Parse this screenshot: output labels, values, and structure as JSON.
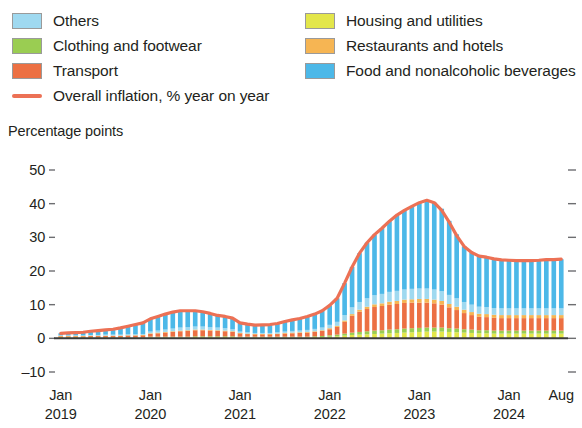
{
  "legend": {
    "left_column": [
      {
        "label": "Others",
        "color": "#9fd9f0",
        "type": "swatch",
        "name": "others"
      },
      {
        "label": "Clothing and footwear",
        "color": "#9acd52",
        "type": "swatch",
        "name": "clothing-and-footwear"
      },
      {
        "label": "Transport",
        "color": "#ec7043",
        "type": "swatch",
        "name": "transport"
      },
      {
        "label": "Overall inflation, % year on year",
        "color": "#ec7155",
        "type": "line",
        "name": "overall-inflation"
      }
    ],
    "right_column": [
      {
        "label": "Housing and utilities",
        "color": "#e3e64a",
        "type": "swatch",
        "name": "housing-and-utilities"
      },
      {
        "label": "Restaurants and hotels",
        "color": "#f6b553",
        "type": "swatch",
        "name": "restaurants-and-hotels"
      },
      {
        "label": "Food and nonalcoholic beverages",
        "color": "#4cb8e8",
        "type": "swatch",
        "name": "food-and-nonalcoholic-beverages"
      }
    ]
  },
  "axis_title": "Percentage points",
  "y_axis": {
    "ticks": [
      "50",
      "40",
      "30",
      "20",
      "10",
      "0",
      "–10"
    ],
    "tick_values": [
      50,
      40,
      30,
      20,
      10,
      0,
      -10
    ],
    "min": -10,
    "max": 50
  },
  "x_axis": {
    "ticks": [
      {
        "month": "Jan",
        "year": "2019"
      },
      {
        "month": "Jan",
        "year": "2020"
      },
      {
        "month": "Jan",
        "year": "2021"
      },
      {
        "month": "Jan",
        "year": "2022"
      },
      {
        "month": "Jan",
        "year": "2023"
      },
      {
        "month": "Jan",
        "year": "2024"
      },
      {
        "month": "Aug",
        "year": ""
      }
    ]
  },
  "chart_data": {
    "type": "bar",
    "stacked": true,
    "title": "",
    "subtitle": "",
    "xlabel": "",
    "ylabel": "Percentage points",
    "ylim": [
      -10,
      50
    ],
    "grid": false,
    "legend_position": "top",
    "x_start": "2019-01",
    "x_end": "2024-08",
    "categories": [
      "Jan 2019",
      "Feb 2019",
      "Mar 2019",
      "Apr 2019",
      "May 2019",
      "Jun 2019",
      "Jul 2019",
      "Aug 2019",
      "Sep 2019",
      "Oct 2019",
      "Nov 2019",
      "Dec 2019",
      "Jan 2020",
      "Feb 2020",
      "Mar 2020",
      "Apr 2020",
      "May 2020",
      "Jun 2020",
      "Jul 2020",
      "Aug 2020",
      "Sep 2020",
      "Oct 2020",
      "Nov 2020",
      "Dec 2020",
      "Jan 2021",
      "Feb 2021",
      "Mar 2021",
      "Apr 2021",
      "May 2021",
      "Jun 2021",
      "Jul 2021",
      "Aug 2021",
      "Sep 2021",
      "Oct 2021",
      "Nov 2021",
      "Dec 2021",
      "Jan 2022",
      "Feb 2022",
      "Mar 2022",
      "Apr 2022",
      "May 2022",
      "Jun 2022",
      "Jul 2022",
      "Aug 2022",
      "Sep 2022",
      "Oct 2022",
      "Nov 2022",
      "Dec 2022",
      "Jan 2023",
      "Feb 2023",
      "Mar 2023",
      "Apr 2023",
      "May 2023",
      "Jun 2023",
      "Jul 2023",
      "Aug 2023",
      "Sep 2023",
      "Oct 2023",
      "Nov 2023",
      "Dec 2023",
      "Jan 2024",
      "Feb 2024",
      "Mar 2024",
      "Apr 2024",
      "May 2024",
      "Jun 2024",
      "Jul 2024",
      "Aug 2024"
    ],
    "series": [
      {
        "name": "Housing and utilities",
        "color": "#e3e64a",
        "values": [
          0.2,
          0.2,
          0.2,
          0.2,
          0.2,
          0.2,
          0.2,
          0.2,
          0.2,
          0.2,
          0.2,
          0.2,
          0.3,
          0.3,
          0.3,
          0.3,
          0.3,
          0.3,
          0.4,
          0.4,
          0.4,
          0.4,
          0.4,
          0.4,
          0.3,
          0.3,
          0.3,
          0.3,
          0.3,
          0.3,
          0.3,
          0.3,
          0.3,
          0.3,
          0.4,
          0.4,
          0.5,
          0.6,
          0.8,
          1.0,
          1.1,
          1.2,
          1.3,
          1.4,
          1.5,
          1.6,
          1.7,
          1.8,
          1.9,
          2.0,
          2.0,
          2.0,
          1.9,
          1.8,
          1.7,
          1.6,
          1.5,
          1.5,
          1.4,
          1.4,
          1.4,
          1.4,
          1.4,
          1.4,
          1.4,
          1.4,
          1.4,
          1.4
        ]
      },
      {
        "name": "Clothing and footwear",
        "color": "#9acd52",
        "values": [
          0.1,
          0.1,
          0.1,
          0.1,
          0.1,
          0.1,
          0.1,
          0.1,
          0.1,
          0.1,
          0.1,
          0.1,
          0.2,
          0.2,
          0.2,
          0.2,
          0.2,
          0.2,
          0.2,
          0.2,
          0.2,
          0.2,
          0.2,
          0.2,
          0.2,
          0.2,
          0.2,
          0.2,
          0.2,
          0.2,
          0.2,
          0.2,
          0.2,
          0.2,
          0.2,
          0.3,
          0.4,
          0.5,
          0.6,
          0.7,
          0.8,
          0.9,
          1.0,
          1.0,
          1.1,
          1.1,
          1.2,
          1.2,
          1.2,
          1.2,
          1.2,
          1.2,
          1.1,
          1.1,
          1.0,
          1.0,
          0.9,
          0.9,
          0.9,
          0.9,
          0.9,
          0.9,
          0.9,
          0.9,
          0.9,
          0.9,
          0.9,
          0.9
        ]
      },
      {
        "name": "Transport",
        "color": "#ec7043",
        "values": [
          0.3,
          0.3,
          0.3,
          0.3,
          0.4,
          0.4,
          0.4,
          0.4,
          0.4,
          0.5,
          0.5,
          0.6,
          0.8,
          1.0,
          1.2,
          1.4,
          1.6,
          1.7,
          1.8,
          1.8,
          1.7,
          1.6,
          1.5,
          1.3,
          1.0,
          0.8,
          0.7,
          0.7,
          0.7,
          0.8,
          0.9,
          1.0,
          1.1,
          1.2,
          1.3,
          1.5,
          1.8,
          2.3,
          3.5,
          5.0,
          6.0,
          6.6,
          7.0,
          7.2,
          7.4,
          7.5,
          7.6,
          7.6,
          7.5,
          7.4,
          7.2,
          6.8,
          6.2,
          5.5,
          4.8,
          4.3,
          4.0,
          3.9,
          3.8,
          3.7,
          3.7,
          3.7,
          3.7,
          3.7,
          3.7,
          3.7,
          3.7,
          3.7
        ]
      },
      {
        "name": "Restaurants and hotels",
        "color": "#f6b553",
        "values": [
          0.1,
          0.1,
          0.1,
          0.1,
          0.1,
          0.1,
          0.1,
          0.1,
          0.1,
          0.1,
          0.1,
          0.1,
          0.2,
          0.2,
          0.2,
          0.2,
          0.2,
          0.2,
          0.2,
          0.2,
          0.2,
          0.2,
          0.2,
          0.2,
          0.1,
          0.1,
          0.1,
          0.1,
          0.1,
          0.1,
          0.2,
          0.2,
          0.2,
          0.2,
          0.2,
          0.2,
          0.3,
          0.3,
          0.4,
          0.5,
          0.6,
          0.7,
          0.8,
          0.8,
          0.9,
          0.9,
          1.0,
          1.0,
          1.1,
          1.1,
          1.1,
          1.1,
          1.0,
          1.0,
          1.0,
          0.9,
          0.9,
          0.9,
          0.9,
          0.9,
          0.9,
          0.9,
          0.9,
          0.9,
          0.9,
          0.9,
          0.9,
          0.9
        ]
      },
      {
        "name": "Others",
        "color": "#9fd9f0",
        "values": [
          0.2,
          0.2,
          0.2,
          0.2,
          0.2,
          0.2,
          0.3,
          0.3,
          0.3,
          0.3,
          0.3,
          0.3,
          0.5,
          0.6,
          0.7,
          0.8,
          0.9,
          0.9,
          0.9,
          0.9,
          0.8,
          0.8,
          0.7,
          0.6,
          0.4,
          0.4,
          0.3,
          0.3,
          0.3,
          0.4,
          0.4,
          0.5,
          0.5,
          0.6,
          0.7,
          0.8,
          1.0,
          1.2,
          1.6,
          2.0,
          2.3,
          2.5,
          2.7,
          2.8,
          2.9,
          3.0,
          3.0,
          3.1,
          3.1,
          3.1,
          3.0,
          2.9,
          2.7,
          2.5,
          2.3,
          2.2,
          2.1,
          2.1,
          2.0,
          2.0,
          2.0,
          2.0,
          2.0,
          2.0,
          2.0,
          2.0,
          2.0,
          2.0
        ]
      },
      {
        "name": "Food and nonalcoholic beverages",
        "color": "#4cb8e8",
        "values": [
          0.6,
          0.7,
          0.8,
          0.9,
          1.1,
          1.3,
          1.5,
          1.7,
          2.0,
          2.4,
          2.9,
          3.3,
          3.8,
          4.2,
          4.6,
          4.9,
          5.0,
          4.9,
          4.7,
          4.4,
          4.1,
          3.8,
          3.5,
          3.2,
          2.6,
          2.4,
          2.3,
          2.4,
          2.5,
          2.7,
          3.0,
          3.3,
          3.6,
          4.0,
          4.4,
          5.0,
          5.8,
          7.0,
          9.5,
          12.0,
          14.5,
          16.5,
          18.0,
          19.5,
          21.0,
          22.5,
          23.5,
          24.5,
          25.5,
          26.2,
          25.8,
          24.5,
          22.0,
          19.0,
          16.5,
          15.5,
          15.0,
          14.8,
          14.6,
          14.4,
          14.3,
          14.2,
          14.2,
          14.2,
          14.3,
          14.4,
          14.5,
          14.6
        ]
      }
    ],
    "line_series": {
      "name": "Overall inflation, % year on year",
      "color": "#ec7155",
      "values": [
        1.5,
        1.6,
        1.7,
        1.8,
        2.1,
        2.3,
        2.5,
        2.7,
        3.1,
        3.6,
        4.1,
        4.6,
        5.8,
        6.5,
        7.2,
        7.8,
        8.2,
        8.2,
        8.2,
        7.9,
        7.4,
        6.8,
        6.5,
        6.0,
        4.6,
        4.2,
        3.9,
        4.0,
        4.1,
        4.4,
        5.0,
        5.5,
        5.9,
        6.5,
        7.2,
        8.2,
        9.8,
        11.9,
        16.4,
        21.2,
        25.3,
        28.4,
        30.8,
        32.7,
        34.8,
        36.6,
        38.0,
        39.2,
        40.3,
        41.0,
        40.3,
        38.0,
        34.5,
        30.5,
        27.3,
        25.5,
        24.4,
        24.1,
        23.6,
        23.3,
        23.2,
        23.1,
        23.1,
        23.1,
        23.2,
        23.4,
        23.4,
        23.5
      ]
    }
  }
}
